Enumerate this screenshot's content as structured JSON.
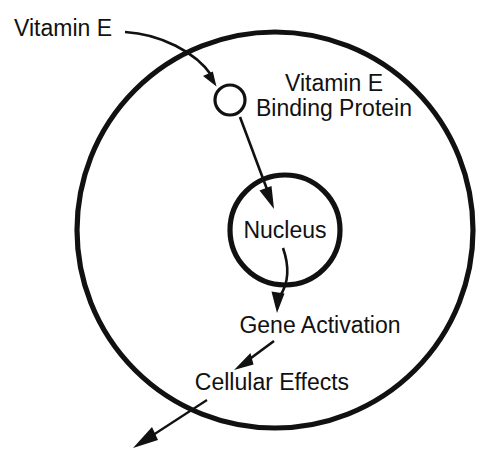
{
  "diagram": {
    "background_color": "#ffffff",
    "stroke_color": "#111111",
    "labels": {
      "vitamin_e": "Vitamin E",
      "binding_protein_line1": "Vitamin E",
      "binding_protein_line2": "Binding Protein",
      "nucleus": "Nucleus",
      "gene_activation": "Gene Activation",
      "cellular_effects": "Cellular Effects"
    },
    "shapes": [
      {
        "name": "cell-membrane",
        "kind": "circle",
        "cx": 275,
        "cy": 230,
        "r": 198,
        "stroke_width": 5.2,
        "fill": "none"
      },
      {
        "name": "binding-protein-circle",
        "kind": "circle",
        "cx": 230,
        "cy": 100,
        "r": 15,
        "stroke_width": 3.2,
        "fill": "none"
      },
      {
        "name": "nucleus-circle",
        "kind": "circle",
        "cx": 285,
        "cy": 230,
        "r": 55,
        "stroke_width": 5.2,
        "fill": "none"
      }
    ],
    "arrows": [
      {
        "name": "vitamin-e-to-protein-arrow",
        "from": "Vitamin E",
        "to": "Vitamin E Binding Protein",
        "style": "curved"
      },
      {
        "name": "protein-to-nucleus-arrow",
        "from": "Vitamin E Binding Protein",
        "to": "Nucleus",
        "style": "straight"
      },
      {
        "name": "nucleus-to-gene-activation-arrow",
        "from": "Nucleus",
        "to": "Gene Activation",
        "style": "curved"
      },
      {
        "name": "gene-activation-to-cellular-effects-arrow",
        "from": "Gene Activation",
        "to": "Cellular Effects",
        "style": "straight"
      },
      {
        "name": "cellular-effects-outward-arrow",
        "from": "Cellular Effects",
        "to": "outside cell",
        "style": "straight"
      }
    ]
  }
}
